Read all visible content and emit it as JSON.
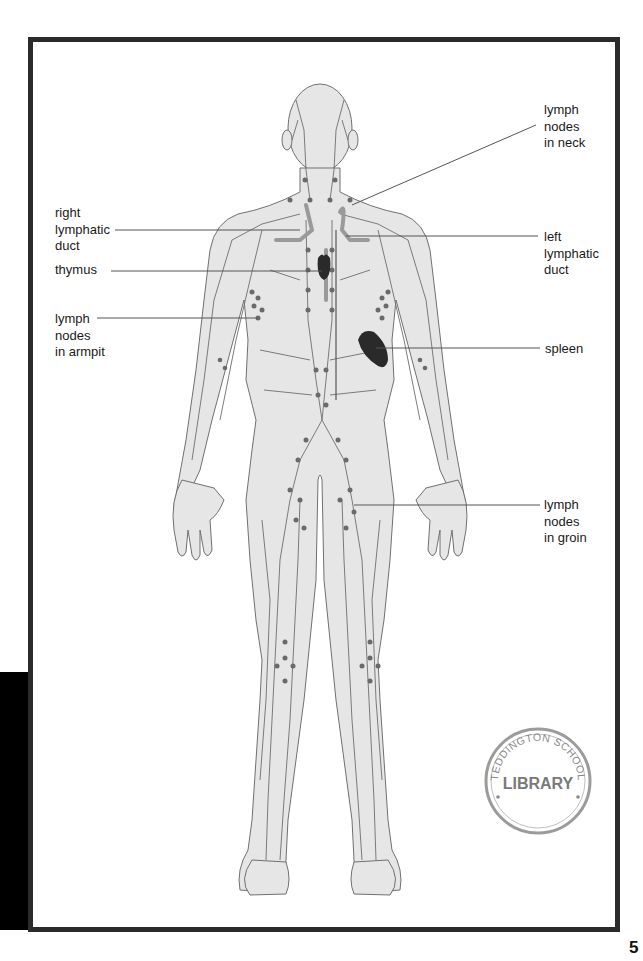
{
  "figure": {
    "labels": {
      "lymph_nodes_neck": "lymph\nnodes\nin neck",
      "right_lymphatic_duct": "right\nlymphatic\nduct",
      "left_lymphatic_duct": "left\nlymphatic\nduct",
      "thymus": "thymus",
      "lymph_nodes_armpit": "lymph\nnodes\nin armpit",
      "spleen": "spleen",
      "lymph_nodes_groin": "lymph\nnodes\nin groin"
    },
    "colors": {
      "body_fill": "#e6e6e6",
      "outline": "#707070",
      "vessel": "#6e6e6e",
      "node": "#6a6a6a",
      "duct": "#9a9a9a",
      "organ": "#2a2a2a",
      "frame": "#2b2b2b"
    }
  },
  "stamp": {
    "top_text": "TEDDINGTON SCHOOL",
    "center_text": "LIBRARY"
  },
  "page": {
    "number": "5"
  }
}
